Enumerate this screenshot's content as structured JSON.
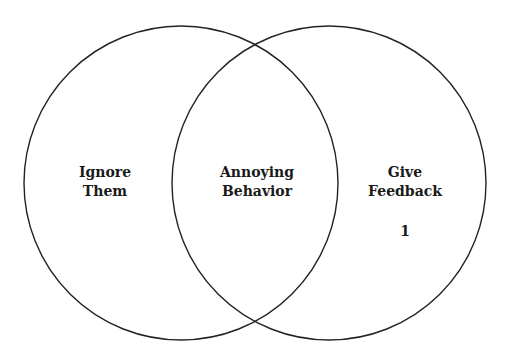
{
  "diagram": {
    "type": "venn",
    "stroke_color": "#222222",
    "background": "#ffffff",
    "circles": [
      {
        "name": "left",
        "cx": 181,
        "cy": 183,
        "r": 157
      },
      {
        "name": "right",
        "cx": 329,
        "cy": 183,
        "r": 157
      }
    ],
    "labels": {
      "left": {
        "line1": "Ignore",
        "line2": "Them"
      },
      "center": {
        "line1": "Annoying",
        "line2": "Behavior"
      },
      "right": {
        "line1": "Give",
        "line2": "Feedback"
      },
      "right_number": "1"
    }
  }
}
